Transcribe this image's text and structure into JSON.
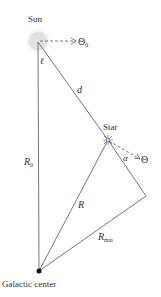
{
  "diagram": {
    "labels": {
      "sun": "Sun",
      "star": "Star",
      "galactic_center": "Galactic center",
      "theta0": "Θ",
      "theta0_sub": "0",
      "theta": "Θ",
      "ell": "ℓ",
      "d": "d",
      "alpha": "α",
      "R0": "R",
      "R0_sub": "0",
      "R": "R",
      "Rmin": "R",
      "Rmin_sub": "min"
    },
    "colors": {
      "line": "#777777",
      "sun_glow": "#cccccc",
      "text": "#333333",
      "center_dot": "#111111"
    }
  }
}
